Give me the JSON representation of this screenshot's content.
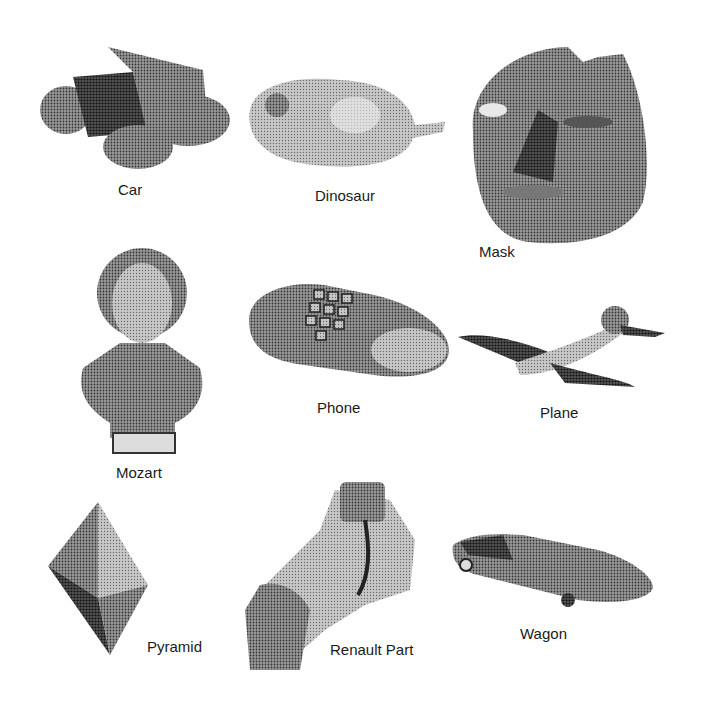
{
  "figure": {
    "objects": [
      {
        "id": "car",
        "label": "Car"
      },
      {
        "id": "dinosaur",
        "label": "Dinosaur"
      },
      {
        "id": "mask",
        "label": "Mask"
      },
      {
        "id": "mozart",
        "label": "Mozart"
      },
      {
        "id": "phone",
        "label": "Phone"
      },
      {
        "id": "plane",
        "label": "Plane"
      },
      {
        "id": "pyramid",
        "label": "Pyramid"
      },
      {
        "id": "renault",
        "label": "Renault Part"
      },
      {
        "id": "wagon",
        "label": "Wagon"
      }
    ]
  }
}
